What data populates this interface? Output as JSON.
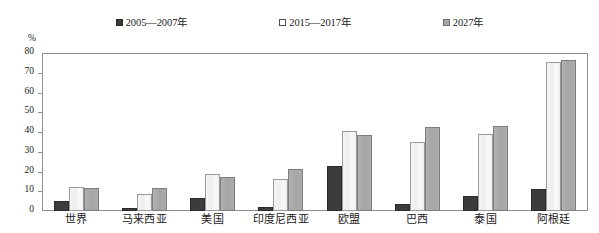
{
  "chart_data": {
    "type": "bar",
    "title": "",
    "xlabel": "",
    "ylabel": "%",
    "ylim": [
      0,
      80
    ],
    "yticks": [
      0,
      10,
      20,
      30,
      40,
      50,
      60,
      70,
      80
    ],
    "grid": false,
    "legend_position": "top",
    "categories": [
      "世界",
      "马来西亚",
      "美国",
      "印度尼西亚",
      "欧盟",
      "巴西",
      "泰国",
      "阿根廷"
    ],
    "series": [
      {
        "name": "2005—2007年",
        "marker": "filled-square",
        "color": "#3c3c3c",
        "values": [
          5,
          1.5,
          6.5,
          2,
          23,
          3.5,
          7.5,
          11
        ]
      },
      {
        "name": "2015—2017年",
        "marker": "hollow-square",
        "color": "#f2f2f2",
        "values": [
          12,
          8.5,
          18.5,
          16,
          40.5,
          35,
          39,
          75.5
        ]
      },
      {
        "name": "2027年",
        "marker": "gray-square",
        "color": "#a8a8a8",
        "values": [
          11.5,
          11.5,
          17,
          21.5,
          38.5,
          42.5,
          43,
          76.5
        ]
      }
    ]
  },
  "axis": {
    "unit": "%"
  }
}
